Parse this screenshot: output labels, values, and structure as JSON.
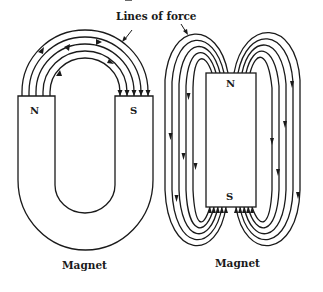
{
  "diagram": {
    "callout_label": "Lines of force",
    "horseshoe_magnet": {
      "label": "Magnet",
      "north_pole": "N",
      "south_pole": "S"
    },
    "bar_magnet": {
      "label": "Magnet",
      "north_pole": "N",
      "south_pole": "S"
    },
    "colors": {
      "stroke": "#1a1a1a",
      "background": "#ffffff"
    }
  }
}
